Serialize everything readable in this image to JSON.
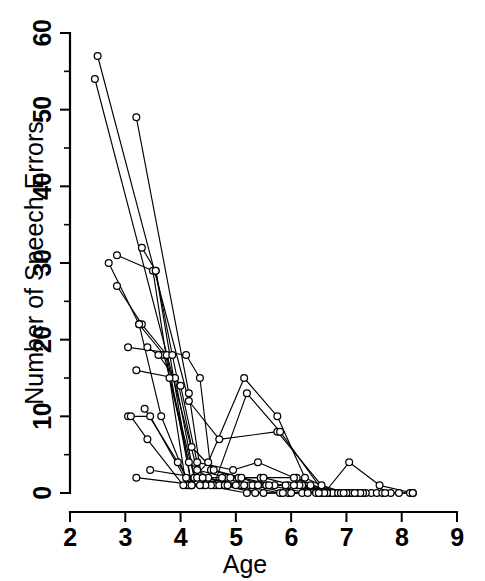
{
  "chart_data": {
    "type": "line",
    "title": "",
    "subtitle": "",
    "xlabel": "Age",
    "ylabel": "Number of Speech Errors",
    "xlim": [
      2,
      9
    ],
    "ylim": [
      0,
      60
    ],
    "xticks": [
      2,
      3,
      4,
      5,
      6,
      7,
      8,
      9
    ],
    "xtick_labels": [
      "2",
      "3",
      "4",
      "5",
      "6",
      "7",
      "8",
      "9"
    ],
    "yticks": [
      0,
      10,
      20,
      30,
      40,
      50,
      60
    ],
    "ytick_labels": [
      "0",
      "10",
      "20",
      "30",
      "40",
      "50",
      "60"
    ],
    "x_minor_ticks": [
      2.5,
      3.5,
      4.5,
      5.5,
      6.5,
      7.5,
      8.5
    ],
    "y_minor_ticks": [
      5,
      15,
      25,
      35,
      45,
      55
    ],
    "grid": false,
    "legend": false,
    "legend_position": "none",
    "marker": "open-circle",
    "marker_color": "#ffffff",
    "line_color": "#000000",
    "background_color": "#ffffff",
    "series": [
      {
        "name": "subject-01",
        "points": [
          [
            2.5,
            57
          ],
          [
            4.15,
            12
          ],
          [
            4.7,
            7
          ],
          [
            5.75,
            8
          ],
          [
            6.55,
            1
          ],
          [
            7.0,
            0
          ],
          [
            7.45,
            0
          ],
          [
            8.2,
            0
          ]
        ]
      },
      {
        "name": "subject-02",
        "points": [
          [
            2.45,
            54
          ],
          [
            4.3,
            3
          ],
          [
            4.85,
            2
          ],
          [
            5.45,
            2
          ],
          [
            6.1,
            2
          ],
          [
            6.7,
            0
          ],
          [
            7.1,
            0
          ],
          [
            8.15,
            0
          ]
        ]
      },
      {
        "name": "subject-03",
        "points": [
          [
            3.2,
            49
          ],
          [
            4.15,
            13
          ],
          [
            4.4,
            1
          ],
          [
            5.1,
            1
          ],
          [
            5.8,
            0
          ],
          [
            6.55,
            0
          ],
          [
            7.05,
            0
          ],
          [
            7.8,
            0
          ]
        ]
      },
      {
        "name": "subject-04",
        "points": [
          [
            3.3,
            32
          ],
          [
            3.55,
            29
          ],
          [
            4.2,
            1
          ],
          [
            4.65,
            1
          ],
          [
            5.35,
            1
          ],
          [
            6.1,
            1
          ],
          [
            6.8,
            0
          ],
          [
            7.35,
            0
          ]
        ]
      },
      {
        "name": "subject-05",
        "points": [
          [
            2.85,
            31
          ],
          [
            3.5,
            29
          ],
          [
            4.1,
            1
          ],
          [
            4.5,
            4
          ],
          [
            5.15,
            15
          ],
          [
            5.75,
            10
          ],
          [
            6.25,
            2
          ],
          [
            6.85,
            0
          ]
        ]
      },
      {
        "name": "subject-06",
        "points": [
          [
            2.7,
            30
          ],
          [
            3.25,
            22
          ],
          [
            3.7,
            18
          ],
          [
            4.25,
            2
          ],
          [
            4.6,
            1
          ],
          [
            5.2,
            13
          ],
          [
            5.8,
            8
          ],
          [
            6.6,
            0
          ],
          [
            7.05,
            4
          ],
          [
            7.6,
            1
          ],
          [
            8.2,
            0
          ]
        ]
      },
      {
        "name": "subject-07",
        "points": [
          [
            2.85,
            27
          ],
          [
            3.3,
            22
          ],
          [
            3.75,
            18
          ],
          [
            4.2,
            1
          ],
          [
            4.55,
            1
          ],
          [
            5.25,
            1
          ],
          [
            5.95,
            1
          ],
          [
            6.7,
            0
          ]
        ]
      },
      {
        "name": "subject-08",
        "points": [
          [
            3.05,
            19
          ],
          [
            4.1,
            18
          ],
          [
            4.35,
            15
          ],
          [
            4.55,
            3
          ],
          [
            5.05,
            2
          ],
          [
            5.55,
            1
          ],
          [
            6.2,
            1
          ],
          [
            6.95,
            0
          ]
        ]
      },
      {
        "name": "subject-09",
        "points": [
          [
            3.4,
            19
          ],
          [
            3.6,
            18
          ],
          [
            4.0,
            14
          ],
          [
            4.3,
            4
          ],
          [
            4.95,
            3
          ],
          [
            5.4,
            4
          ],
          [
            6.05,
            2
          ],
          [
            6.75,
            0
          ]
        ]
      },
      {
        "name": "subject-10",
        "points": [
          [
            3.2,
            16
          ],
          [
            3.9,
            15
          ],
          [
            4.25,
            2
          ],
          [
            4.75,
            2
          ],
          [
            5.3,
            1
          ],
          [
            5.95,
            0
          ],
          [
            6.5,
            0
          ],
          [
            7.2,
            0
          ]
        ]
      },
      {
        "name": "subject-11",
        "points": [
          [
            3.05,
            10
          ],
          [
            3.45,
            10
          ],
          [
            4.15,
            1
          ],
          [
            4.7,
            1
          ],
          [
            5.4,
            1
          ],
          [
            6.15,
            1
          ],
          [
            6.85,
            0
          ],
          [
            7.55,
            0
          ]
        ]
      },
      {
        "name": "subject-12",
        "points": [
          [
            3.1,
            10
          ],
          [
            3.4,
            7
          ],
          [
            4.05,
            1
          ],
          [
            4.45,
            1
          ],
          [
            5.2,
            0
          ],
          [
            5.85,
            0
          ],
          [
            6.45,
            0
          ],
          [
            7.1,
            0
          ]
        ]
      },
      {
        "name": "subject-13",
        "points": [
          [
            3.35,
            11
          ],
          [
            3.95,
            4
          ],
          [
            4.2,
            1
          ],
          [
            4.9,
            2
          ],
          [
            5.5,
            2
          ],
          [
            6.05,
            1
          ],
          [
            6.65,
            0
          ],
          [
            7.3,
            0
          ]
        ]
      },
      {
        "name": "subject-14",
        "points": [
          [
            3.45,
            3
          ],
          [
            4.3,
            2
          ],
          [
            4.8,
            1
          ],
          [
            5.35,
            0
          ],
          [
            6.0,
            0
          ],
          [
            6.6,
            0
          ],
          [
            7.25,
            0
          ],
          [
            7.95,
            0
          ]
        ]
      },
      {
        "name": "subject-15",
        "points": [
          [
            3.2,
            2
          ],
          [
            4.35,
            1
          ],
          [
            4.85,
            1
          ],
          [
            5.5,
            0
          ],
          [
            6.2,
            0
          ],
          [
            6.9,
            0
          ],
          [
            7.65,
            0
          ],
          [
            8.2,
            0
          ]
        ]
      },
      {
        "name": "subject-16",
        "points": [
          [
            3.55,
            29
          ],
          [
            3.85,
            18
          ],
          [
            4.2,
            6
          ],
          [
            4.6,
            3
          ],
          [
            5.1,
            2
          ],
          [
            5.7,
            1
          ],
          [
            6.35,
            1
          ],
          [
            7.0,
            0
          ]
        ]
      },
      {
        "name": "subject-17",
        "points": [
          [
            3.8,
            15
          ],
          [
            4.15,
            4
          ],
          [
            4.5,
            2
          ],
          [
            5.0,
            1
          ],
          [
            5.6,
            1
          ],
          [
            6.3,
            0
          ],
          [
            6.95,
            0
          ],
          [
            7.7,
            0
          ]
        ]
      },
      {
        "name": "subject-18",
        "points": [
          [
            3.25,
            22
          ],
          [
            3.65,
            10
          ],
          [
            4.1,
            2
          ],
          [
            4.4,
            2
          ],
          [
            5.15,
            1
          ],
          [
            5.9,
            1
          ],
          [
            6.5,
            0
          ],
          [
            7.15,
            0
          ]
        ]
      }
    ]
  },
  "axis": {
    "x_title": "Age",
    "y_title": "Number of Speech Errors"
  }
}
